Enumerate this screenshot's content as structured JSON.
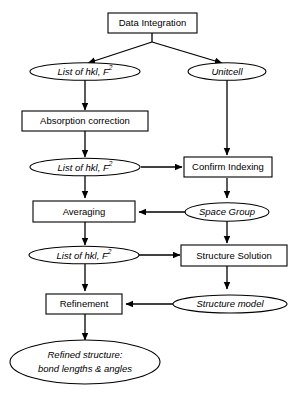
{
  "diagram": {
    "background_color": "#ffffff",
    "stroke_color": "#000000",
    "process_nodes": [
      {
        "id": "data-integration",
        "label": "Data Integration",
        "shape": "rectangle"
      },
      {
        "id": "absorption-correction",
        "label": "Absorption correction",
        "shape": "rectangle"
      },
      {
        "id": "confirm-indexing",
        "label": "Confirm Indexing",
        "shape": "rectangle"
      },
      {
        "id": "averaging",
        "label": "Averaging",
        "shape": "rectangle"
      },
      {
        "id": "structure-solution",
        "label": "Structure Solution",
        "shape": "rectangle"
      },
      {
        "id": "refinement",
        "label": "Refinement",
        "shape": "rectangle"
      }
    ],
    "data_nodes": [
      {
        "id": "hkl-list-1",
        "label": "List of hkl, F",
        "superscript": "2",
        "shape": "ellipse",
        "italic": true
      },
      {
        "id": "unitcell",
        "label": "Unitcell",
        "superscript": "",
        "shape": "ellipse",
        "italic": true
      },
      {
        "id": "hkl-list-2",
        "label": "List of hkl, F",
        "superscript": "2",
        "shape": "ellipse",
        "italic": true
      },
      {
        "id": "hkl-list-3",
        "label": "List of hkl, F",
        "superscript": "2",
        "shape": "ellipse",
        "italic": true
      },
      {
        "id": "space-group",
        "label": "Space Group",
        "superscript": "",
        "shape": "ellipse",
        "italic": true
      },
      {
        "id": "structure-model",
        "label": "Structure model",
        "superscript": "",
        "shape": "ellipse",
        "italic": true
      },
      {
        "id": "refined-structure",
        "label_line1": "Refined structure:",
        "label_line2": "bond lengths & angles",
        "shape": "ellipse",
        "italic": true
      }
    ],
    "edges": [
      {
        "from": "data-integration",
        "to": "hkl-list-1",
        "direction": "diagonal-left"
      },
      {
        "from": "data-integration",
        "to": "unitcell",
        "direction": "diagonal-right"
      },
      {
        "from": "hkl-list-1",
        "to": "absorption-correction",
        "direction": "down"
      },
      {
        "from": "absorption-correction",
        "to": "hkl-list-2",
        "direction": "down"
      },
      {
        "from": "unitcell",
        "to": "confirm-indexing",
        "direction": "down"
      },
      {
        "from": "hkl-list-2",
        "to": "confirm-indexing",
        "direction": "right"
      },
      {
        "from": "hkl-list-2",
        "to": "averaging",
        "direction": "down"
      },
      {
        "from": "confirm-indexing",
        "to": "space-group",
        "direction": "down"
      },
      {
        "from": "space-group",
        "to": "averaging",
        "direction": "left"
      },
      {
        "from": "space-group",
        "to": "structure-solution",
        "direction": "down"
      },
      {
        "from": "averaging",
        "to": "hkl-list-3",
        "direction": "down"
      },
      {
        "from": "hkl-list-3",
        "to": "structure-solution",
        "direction": "right"
      },
      {
        "from": "hkl-list-3",
        "to": "refinement",
        "direction": "down"
      },
      {
        "from": "structure-solution",
        "to": "structure-model",
        "direction": "down"
      },
      {
        "from": "structure-model",
        "to": "refinement",
        "direction": "left"
      },
      {
        "from": "refinement",
        "to": "refined-structure",
        "direction": "down"
      }
    ]
  }
}
